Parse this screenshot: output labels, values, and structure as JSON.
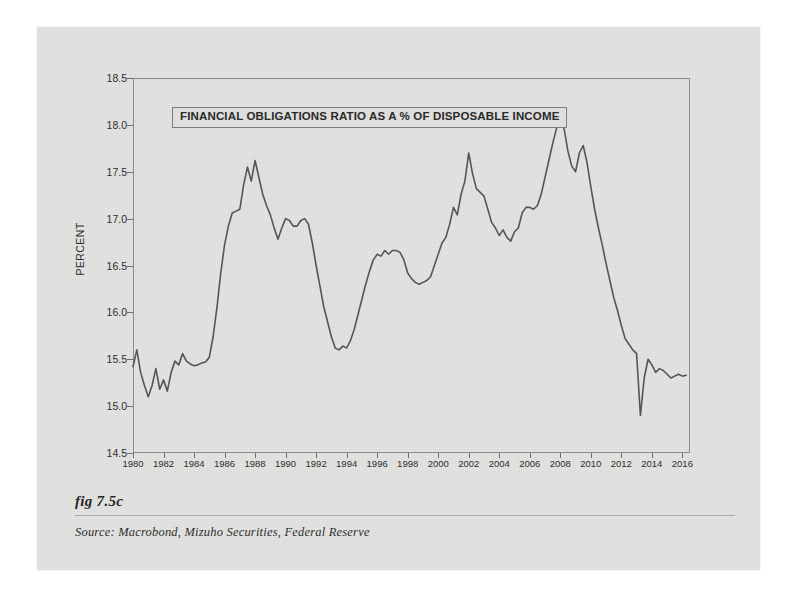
{
  "figure": {
    "fig_label": "fig 7.5c",
    "source": "Source:  Macrobond, Mizuho Securities, Federal Reserve"
  },
  "colors": {
    "paper": "#e3e3e1",
    "line": "#555553",
    "frame": "#8b8b89",
    "text": "#2a2a2a",
    "title_box_fill": "#dededc"
  },
  "chart_data": {
    "type": "line",
    "title": "FINANCIAL OBLIGATIONS RATIO AS A % OF DISPOSABLE INCOME",
    "xlabel": "",
    "ylabel": "PERCENT",
    "xlim": [
      1980,
      2016.5
    ],
    "ylim": [
      14.5,
      18.5
    ],
    "grid": false,
    "legend": "none",
    "xticks": [
      1980,
      1982,
      1984,
      1986,
      1988,
      1990,
      1992,
      1994,
      1996,
      1998,
      2000,
      2002,
      2004,
      2006,
      2008,
      2010,
      2012,
      2014,
      2016
    ],
    "xtick_labels": [
      "1980",
      "1982",
      "1984",
      "1986",
      "1988",
      "1990",
      "1992",
      "1994",
      "1996",
      "1998",
      "2000",
      "2002",
      "2004",
      "2006",
      "2008",
      "2010",
      "2012",
      "2014",
      "2016"
    ],
    "yticks": [
      14.5,
      15.0,
      15.5,
      16.0,
      16.5,
      17.0,
      17.5,
      18.0,
      18.5
    ],
    "ytick_labels": [
      "14.5",
      "15.0",
      "15.5",
      "16.0",
      "16.5",
      "17.0",
      "17.5",
      "18.0",
      "18.5"
    ],
    "series": [
      {
        "name": "Financial Obligations Ratio",
        "x": [
          1980.0,
          1980.25,
          1980.5,
          1980.75,
          1981.0,
          1981.25,
          1981.5,
          1981.75,
          1982.0,
          1982.25,
          1982.5,
          1982.75,
          1983.0,
          1983.25,
          1983.5,
          1983.75,
          1984.0,
          1984.25,
          1984.5,
          1984.75,
          1985.0,
          1985.25,
          1985.5,
          1985.75,
          1986.0,
          1986.25,
          1986.5,
          1986.75,
          1987.0,
          1987.25,
          1987.5,
          1987.75,
          1988.0,
          1988.25,
          1988.5,
          1988.75,
          1989.0,
          1989.25,
          1989.5,
          1989.75,
          1990.0,
          1990.25,
          1990.5,
          1990.75,
          1991.0,
          1991.25,
          1991.5,
          1991.75,
          1992.0,
          1992.25,
          1992.5,
          1992.75,
          1993.0,
          1993.25,
          1993.5,
          1993.75,
          1994.0,
          1994.25,
          1994.5,
          1994.75,
          1995.0,
          1995.25,
          1995.5,
          1995.75,
          1996.0,
          1996.25,
          1996.5,
          1996.75,
          1997.0,
          1997.25,
          1997.5,
          1997.75,
          1998.0,
          1998.25,
          1998.5,
          1998.75,
          1999.0,
          1999.25,
          1999.5,
          1999.75,
          2000.0,
          2000.25,
          2000.5,
          2000.75,
          2001.0,
          2001.25,
          2001.5,
          2001.75,
          2002.0,
          2002.25,
          2002.5,
          2002.75,
          2003.0,
          2003.25,
          2003.5,
          2003.75,
          2004.0,
          2004.25,
          2004.5,
          2004.75,
          2005.0,
          2005.25,
          2005.5,
          2005.75,
          2006.0,
          2006.25,
          2006.5,
          2006.75,
          2007.0,
          2007.25,
          2007.5,
          2007.75,
          2008.0,
          2008.25,
          2008.5,
          2008.75,
          2009.0,
          2009.25,
          2009.5,
          2009.75,
          2010.0,
          2010.25,
          2010.5,
          2010.75,
          2011.0,
          2011.25,
          2011.5,
          2011.75,
          2012.0,
          2012.25,
          2012.5,
          2012.75,
          2013.0,
          2013.25,
          2013.5,
          2013.75,
          2014.0,
          2014.25,
          2014.5,
          2014.75,
          2015.0,
          2015.25,
          2015.5,
          2015.75,
          2016.0,
          2016.25
        ],
        "y": [
          15.42,
          15.6,
          15.36,
          15.22,
          15.1,
          15.22,
          15.4,
          15.18,
          15.28,
          15.16,
          15.36,
          15.48,
          15.44,
          15.56,
          15.48,
          15.45,
          15.43,
          15.44,
          15.46,
          15.47,
          15.52,
          15.74,
          16.05,
          16.42,
          16.72,
          16.92,
          17.06,
          17.08,
          17.1,
          17.36,
          17.55,
          17.4,
          17.62,
          17.44,
          17.26,
          17.14,
          17.04,
          16.9,
          16.78,
          16.9,
          17.0,
          16.98,
          16.92,
          16.92,
          16.98,
          17.0,
          16.94,
          16.74,
          16.5,
          16.28,
          16.06,
          15.9,
          15.74,
          15.62,
          15.6,
          15.64,
          15.62,
          15.7,
          15.82,
          15.98,
          16.14,
          16.3,
          16.44,
          16.56,
          16.62,
          16.6,
          16.66,
          16.62,
          16.66,
          16.66,
          16.64,
          16.56,
          16.42,
          16.36,
          16.32,
          16.3,
          16.32,
          16.34,
          16.38,
          16.5,
          16.62,
          16.74,
          16.8,
          16.94,
          17.12,
          17.04,
          17.26,
          17.4,
          17.7,
          17.48,
          17.32,
          17.28,
          17.24,
          17.1,
          16.96,
          16.9,
          16.82,
          16.88,
          16.8,
          16.76,
          16.86,
          16.9,
          17.06,
          17.12,
          17.12,
          17.1,
          17.14,
          17.26,
          17.44,
          17.62,
          17.8,
          17.96,
          18.1,
          17.96,
          17.72,
          17.56,
          17.5,
          17.7,
          17.78,
          17.6,
          17.34,
          17.1,
          16.9,
          16.72,
          16.52,
          16.34,
          16.16,
          16.02,
          15.86,
          15.72,
          15.66,
          15.6,
          15.56,
          14.9,
          15.3,
          15.5,
          15.44,
          15.36,
          15.4,
          15.38,
          15.34,
          15.3,
          15.32,
          15.34,
          15.32,
          15.33
        ]
      }
    ]
  }
}
